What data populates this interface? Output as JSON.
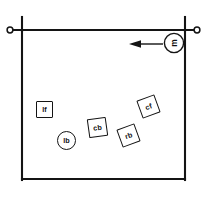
{
  "diagram": {
    "background_color": "#ffffff",
    "stroke_color": "#141414",
    "field": {
      "name": "field-outline",
      "shape": "rectangle",
      "x": 22,
      "y": 30,
      "width": 163,
      "height": 150
    },
    "crossbar": {
      "name": "horizontal-bar",
      "x1": 10,
      "y1": 30,
      "x2": 197,
      "y2": 30,
      "end_markers": "ring",
      "posts": [
        {
          "x": 22,
          "y_top": 18,
          "y_bottom": 180
        },
        {
          "x": 185,
          "y_top": 18,
          "y_bottom": 180
        }
      ]
    },
    "arrow": {
      "name": "direction-arrow",
      "label": "m",
      "direction": "left",
      "tail_x": 163,
      "tip_x": 130,
      "y": 44
    },
    "callout": {
      "name": "callout-marker-m",
      "label": "m",
      "shape": "circle",
      "rotated": true,
      "cx": 174,
      "cy": 43,
      "r": 10
    },
    "markers": [
      {
        "id": "lf",
        "label": "lf",
        "shape": "square",
        "x": 36,
        "y": 101,
        "size": 17,
        "rotation": 0
      },
      {
        "id": "lb",
        "label": "lb",
        "shape": "circle",
        "x": 57,
        "y": 131,
        "size": 19,
        "rotation": 0
      },
      {
        "id": "cb",
        "label": "cb",
        "shape": "square",
        "x": 88,
        "y": 118,
        "size": 19,
        "rotation": -8
      },
      {
        "id": "rb",
        "label": "rb",
        "shape": "square",
        "x": 119,
        "y": 126,
        "size": 19,
        "rotation": -20
      },
      {
        "id": "cf",
        "label": "cf",
        "shape": "square",
        "x": 139,
        "y": 97,
        "size": 19,
        "rotation": -20
      }
    ]
  }
}
